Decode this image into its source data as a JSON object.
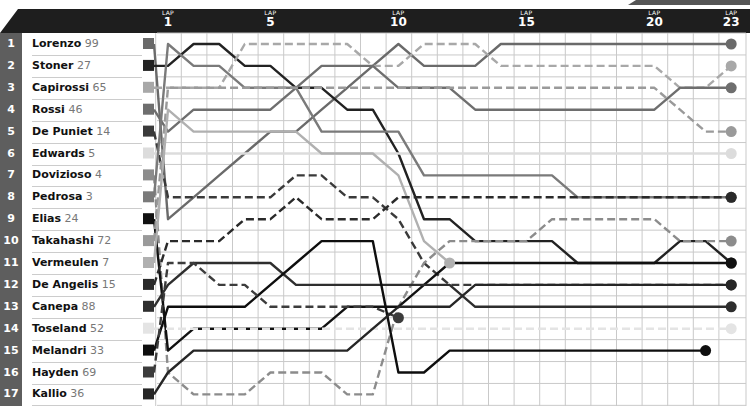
{
  "header": {
    "lap_word": "LAP",
    "lap_ticks": [
      {
        "lap": 1,
        "label": "1"
      },
      {
        "lap": 5,
        "label": "5"
      },
      {
        "lap": 10,
        "label": "10"
      },
      {
        "lap": 15,
        "label": "15"
      },
      {
        "lap": 20,
        "label": "20"
      },
      {
        "lap": 23,
        "label": "23"
      }
    ]
  },
  "grid": {
    "rows": [
      "1",
      "2",
      "3",
      "4",
      "5",
      "6",
      "7",
      "8",
      "9",
      "10",
      "11",
      "12",
      "13",
      "14",
      "15",
      "16",
      "17"
    ]
  },
  "riders": [
    {
      "pos": "1",
      "name": "Lorenzo",
      "number": "99",
      "color": "#6a6a6a",
      "dash": false
    },
    {
      "pos": "2",
      "name": "Stoner",
      "number": "27",
      "color": "#222222",
      "dash": false
    },
    {
      "pos": "3",
      "name": "Capirossi",
      "number": "65",
      "color": "#a8a8a8",
      "dash": true
    },
    {
      "pos": "4",
      "name": "Rossi",
      "number": "46",
      "color": "#6e6e6e",
      "dash": false
    },
    {
      "pos": "5",
      "name": "De Puniet",
      "number": "14",
      "color": "#3a3a3a",
      "dash": true
    },
    {
      "pos": "6",
      "name": "Edwards",
      "number": "5",
      "color": "#dcdcdc",
      "dash": false
    },
    {
      "pos": "7",
      "name": "Dovizioso",
      "number": "4",
      "color": "#8c8c8c",
      "dash": true
    },
    {
      "pos": "8",
      "name": "Pedrosa",
      "number": "3",
      "color": "#7a7a7a",
      "dash": false
    },
    {
      "pos": "9",
      "name": "Elias",
      "number": "24",
      "color": "#111111",
      "dash": false
    },
    {
      "pos": "10",
      "name": "Takahashi",
      "number": "72",
      "color": "#9a9a9a",
      "dash": true
    },
    {
      "pos": "11",
      "name": "Vermeulen",
      "number": "7",
      "color": "#b0b0b0",
      "dash": false
    },
    {
      "pos": "12",
      "name": "De Angelis",
      "number": "15",
      "color": "#2a2a2a",
      "dash": true
    },
    {
      "pos": "13",
      "name": "Canepa",
      "number": "88",
      "color": "#2e2e2e",
      "dash": false
    },
    {
      "pos": "14",
      "name": "Toseland",
      "number": "52",
      "color": "#e4e4e4",
      "dash": true
    },
    {
      "pos": "15",
      "name": "Melandri",
      "number": "33",
      "color": "#0e0e0e",
      "dash": false
    },
    {
      "pos": "16",
      "name": "Hayden",
      "number": "69",
      "color": "#3c3c3c",
      "dash": true
    },
    {
      "pos": "17",
      "name": "Kallio",
      "number": "36",
      "color": "#262626",
      "dash": false
    }
  ],
  "chart_data": {
    "type": "line",
    "xlabel": "LAP",
    "ylabel": "Position",
    "x": [
      0,
      1,
      2,
      3,
      4,
      5,
      6,
      7,
      8,
      9,
      10,
      11,
      12,
      13,
      14,
      15,
      16,
      17,
      18,
      19,
      20,
      21,
      22,
      23
    ],
    "ylim": [
      17,
      1
    ],
    "xticks": [
      1,
      5,
      10,
      15,
      20,
      23
    ],
    "series": [
      {
        "name": "Lorenzo 99",
        "values": [
          1,
          9,
          8,
          7,
          6,
          5,
          5,
          4,
          3,
          2,
          1,
          2,
          2,
          2,
          1,
          1,
          1,
          1,
          1,
          1,
          1,
          1,
          1,
          1
        ]
      },
      {
        "name": "Stoner 27",
        "values": [
          2,
          2,
          1,
          1,
          2,
          2,
          3,
          3,
          4,
          4,
          6,
          9,
          9,
          10,
          10,
          10,
          10,
          11,
          11,
          11,
          11,
          10,
          10,
          11
        ]
      },
      {
        "name": "Capirossi 65",
        "values": [
          3,
          3,
          3,
          3,
          1,
          1,
          1,
          1,
          1,
          2,
          2,
          1,
          1,
          1,
          2,
          2,
          2,
          2,
          2,
          2,
          2,
          3,
          3,
          2
        ]
      },
      {
        "name": "Rossi 46",
        "values": [
          4,
          5,
          4,
          4,
          4,
          4,
          3,
          2,
          2,
          2,
          3,
          3,
          3,
          4,
          4,
          4,
          4,
          4,
          4,
          4,
          4,
          3,
          3,
          3
        ]
      },
      {
        "name": "De Puniet 14",
        "values": [
          5,
          8,
          8,
          8,
          8,
          8,
          7,
          7,
          8,
          8,
          9,
          11,
          12,
          12,
          12,
          12,
          12,
          12,
          12,
          12,
          12,
          12,
          12,
          12
        ]
      },
      {
        "name": "Edwards 5",
        "values": [
          6,
          6,
          6,
          6,
          6,
          6,
          6,
          6,
          6,
          6,
          6,
          6,
          6,
          6,
          6,
          6,
          6,
          6,
          6,
          6,
          6,
          6,
          6,
          6
        ]
      },
      {
        "name": "Dovizioso 4",
        "values": [
          7,
          16,
          17,
          17,
          17,
          16,
          16,
          16,
          17,
          17,
          13,
          11,
          10,
          10,
          10,
          10,
          9,
          9,
          9,
          9,
          9,
          10,
          10,
          10
        ]
      },
      {
        "name": "Pedrosa 3",
        "values": [
          8,
          1,
          2,
          2,
          3,
          3,
          3,
          5,
          5,
          5,
          5,
          7,
          7,
          7,
          7,
          7,
          7,
          8,
          8,
          8,
          8,
          8,
          8,
          8
        ]
      },
      {
        "name": "Elias 24",
        "values": [
          9,
          15,
          14,
          14,
          14,
          14,
          14,
          14,
          13,
          13,
          13,
          12,
          11,
          11,
          11,
          11,
          11,
          11,
          11,
          11,
          11,
          11,
          11,
          11
        ]
      },
      {
        "name": "Takahashi 72",
        "values": [
          10,
          3,
          3,
          3,
          3,
          3,
          3,
          3,
          3,
          3,
          3,
          3,
          3,
          3,
          3,
          3,
          3,
          3,
          3,
          3,
          3,
          4,
          5,
          5
        ]
      },
      {
        "name": "Vermeulen 7",
        "values": [
          11,
          4,
          5,
          5,
          5,
          5,
          5,
          6,
          6,
          6,
          7,
          10,
          11,
          null,
          null,
          null,
          null,
          null,
          null,
          null,
          null,
          null,
          null,
          null
        ]
      },
      {
        "name": "De Angelis 15",
        "values": [
          12,
          10,
          10,
          10,
          9,
          9,
          8,
          9,
          9,
          9,
          8,
          8,
          8,
          8,
          8,
          8,
          8,
          8,
          8,
          8,
          8,
          8,
          8,
          8
        ]
      },
      {
        "name": "Canepa 88",
        "values": [
          13,
          12,
          11,
          11,
          11,
          11,
          12,
          12,
          12,
          12,
          12,
          12,
          12,
          13,
          13,
          13,
          13,
          13,
          13,
          13,
          13,
          13,
          13,
          13
        ]
      },
      {
        "name": "Toseland 52",
        "values": [
          14,
          14,
          14,
          14,
          14,
          14,
          14,
          14,
          14,
          14,
          14,
          14,
          14,
          14,
          14,
          14,
          14,
          14,
          14,
          14,
          14,
          14,
          14,
          14
        ]
      },
      {
        "name": "Melandri 33",
        "values": [
          15,
          13,
          13,
          13,
          13,
          12,
          11,
          10,
          10,
          10,
          16,
          16,
          15,
          15,
          15,
          15,
          15,
          15,
          15,
          15,
          15,
          15,
          15,
          null
        ]
      },
      {
        "name": "Hayden 69",
        "values": [
          16,
          11,
          11,
          12,
          12,
          13,
          13,
          13,
          13,
          13,
          13.5,
          null,
          null,
          null,
          null,
          null,
          null,
          null,
          null,
          null,
          null,
          null,
          null,
          null
        ]
      },
      {
        "name": "Kallio 36",
        "values": [
          17,
          16,
          15,
          15,
          15,
          15,
          15,
          15,
          15,
          14,
          13,
          13,
          13,
          12,
          12,
          12,
          12,
          12,
          12,
          12,
          12,
          12,
          12,
          12
        ]
      }
    ]
  }
}
